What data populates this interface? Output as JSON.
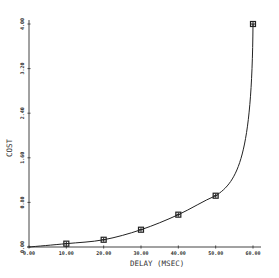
{
  "chart_data": {
    "type": "line",
    "title": "",
    "xlabel": "DELAY (MSEC)",
    "ylabel": "COST",
    "xlim": [
      0,
      60
    ],
    "ylim": [
      0,
      4
    ],
    "x_ticks": [
      "0.00",
      "10.00",
      "20.00",
      "30.00",
      "40.00",
      "50.00",
      "60.00"
    ],
    "y_ticks": [
      "0.00",
      "0.80",
      "1.60",
      "2.40",
      "3.20",
      "4.00"
    ],
    "grid": false,
    "legend": null,
    "series": [
      {
        "name": "cost",
        "marker": "square",
        "x": [
          10,
          20,
          30,
          40,
          50,
          60
        ],
        "y": [
          0.06,
          0.13,
          0.31,
          0.58,
          0.92,
          4.0
        ]
      }
    ],
    "colors": {
      "line": "#222222",
      "axis": "#444444",
      "marker": "#222222"
    }
  }
}
